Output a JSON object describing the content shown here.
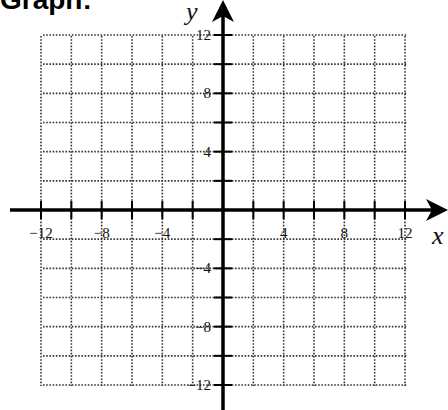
{
  "page": {
    "title": "Graph:"
  },
  "chart_data": {
    "type": "scatter",
    "title": "Graph:",
    "xlabel": "x",
    "ylabel": "y",
    "xlim": [
      -12,
      12
    ],
    "ylim": [
      -12,
      12
    ],
    "grid": true,
    "grid_style": "dotted",
    "grid_step": 2,
    "x_tick_labels": [
      "-12",
      "-8",
      "-4",
      "4",
      "8",
      "12"
    ],
    "y_tick_labels": [
      "12",
      "8",
      "4",
      "-4",
      "-8",
      "-12"
    ],
    "x_ticks": [
      -12,
      -8,
      -4,
      4,
      8,
      12
    ],
    "y_ticks": [
      12,
      8,
      4,
      -4,
      -8,
      -12
    ],
    "series": [],
    "legend": null
  },
  "colors": {
    "axis": "#000000",
    "grid": "#333333",
    "background": "#ffffff"
  }
}
